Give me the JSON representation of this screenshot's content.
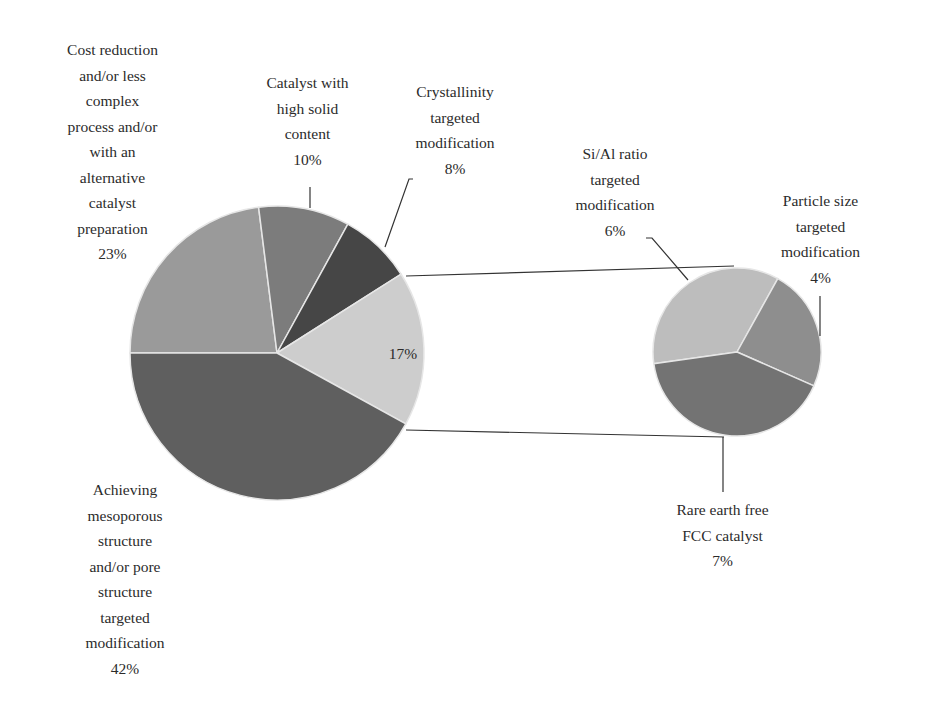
{
  "chart_data": {
    "type": "pie",
    "subtype": "pie-of-pie",
    "title": "",
    "main_pie": {
      "slices": [
        {
          "label": "Achieving mesoporous structure and/or pore structure targeted modification",
          "value": 42,
          "color": "#5f5f5f"
        },
        {
          "label": "Cost reduction and/or less complex process and/or with an alternative catalyst preparation",
          "value": 23,
          "color": "#9a9a9a"
        },
        {
          "label": "Catalyst with high solid content",
          "value": 10,
          "color": "#7c7c7c"
        },
        {
          "label": "Crystallinity targeted modification",
          "value": 8,
          "color": "#464646"
        },
        {
          "label": "Other (expanded)",
          "value": 17,
          "color": "#cdcdcd"
        }
      ]
    },
    "secondary_pie": {
      "total": 17,
      "slices": [
        {
          "label": "Si/Al ratio targeted modification",
          "value": 6,
          "color": "#bdbdbd"
        },
        {
          "label": "Particle size targeted modification",
          "value": 4,
          "color": "#8e8e8e"
        },
        {
          "label": "Rare earth free FCC catalyst",
          "value": 7,
          "color": "#737373"
        }
      ]
    }
  },
  "labels": {
    "cost": "Cost reduction\nand/or less\ncomplex\nprocess and/or\nwith an\nalternative\ncatalyst\npreparation\n23%",
    "solid": "Catalyst with\nhigh solid\ncontent\n10%",
    "crystal": "Crystallinity\ntargeted\nmodification\n8%",
    "sial": "Si/Al ratio\ntargeted\nmodification\n6%",
    "particle": "Particle size\ntargeted\nmodification\n4%",
    "other": "17%",
    "rare": "Rare earth free\nFCC catalyst\n7%",
    "meso": "Achieving\nmesoporous\nstructure\nand/or pore\nstructure\ntargeted\nmodification\n42%"
  }
}
